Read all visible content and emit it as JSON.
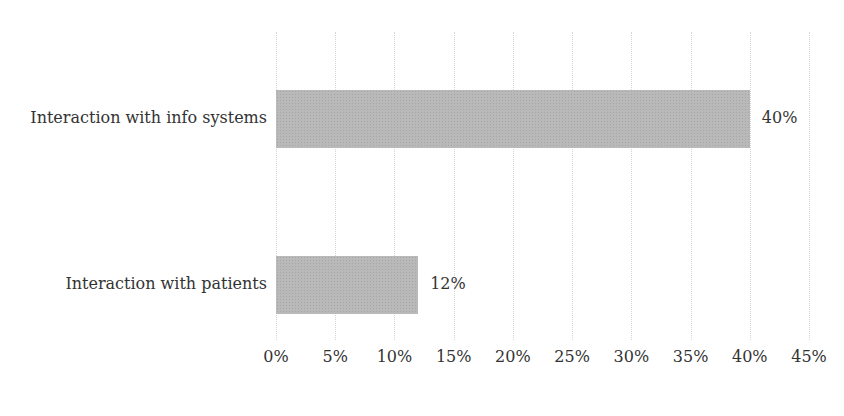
{
  "chart_data": {
    "type": "bar",
    "orientation": "horizontal",
    "title": "",
    "categories": [
      "Interaction with info systems",
      "Interaction with patients"
    ],
    "values": [
      40,
      12
    ],
    "value_labels": [
      "40%",
      "12%"
    ],
    "xlabel": "",
    "ylabel": "",
    "xlim": [
      0,
      45
    ],
    "x_ticks": [
      "0%",
      "5%",
      "10%",
      "15%",
      "20%",
      "25%",
      "30%",
      "35%",
      "40%",
      "45%"
    ],
    "grid": true,
    "legend": null,
    "bar_color": "#b9b9b9"
  }
}
